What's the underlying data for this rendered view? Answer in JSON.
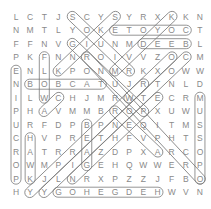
{
  "puzzle": {
    "grid": [
      [
        "L",
        "C",
        "T",
        "J",
        "S",
        "C",
        "Y",
        "S",
        "Y",
        "R",
        "X",
        "K",
        "K",
        "N"
      ],
      [
        "N",
        "M",
        "T",
        "L",
        "Y",
        "O",
        "K",
        "E",
        "T",
        "O",
        "Y",
        "O",
        "C",
        "T"
      ],
      [
        "F",
        "F",
        "N",
        "V",
        "G",
        "I",
        "U",
        "N",
        "M",
        "D",
        "E",
        "E",
        "B",
        "L"
      ],
      [
        "P",
        "K",
        "F",
        "N",
        "N",
        "R",
        "O",
        "I",
        "V",
        "V",
        "Z",
        "O",
        "C",
        "M"
      ],
      [
        "E",
        "N",
        "L",
        "K",
        "P",
        "O",
        "N",
        "M",
        "R",
        "K",
        "X",
        "O",
        "W",
        "W"
      ],
      [
        "N",
        "B",
        "O",
        "B",
        "C",
        "A",
        "T",
        "U",
        "J",
        "R",
        "T",
        "N",
        "L",
        "D"
      ],
      [
        "I",
        "L",
        "W",
        "C",
        "H",
        "J",
        "M",
        "R",
        "W",
        "T",
        "E",
        "C",
        "R",
        "M"
      ],
      [
        "P",
        "H",
        "A",
        "V",
        "M",
        "M",
        "B",
        "R",
        "O",
        "P",
        "X",
        "U",
        "W",
        "U"
      ],
      [
        "U",
        "R",
        "F",
        "D",
        "P",
        "B",
        "P",
        "N",
        "E",
        "Q",
        "I",
        "T",
        "M",
        "S"
      ],
      [
        "C",
        "H",
        "V",
        "P",
        "R",
        "E",
        "T",
        "H",
        "F",
        "V",
        "P",
        "H",
        "T",
        "S"
      ],
      [
        "R",
        "A",
        "T",
        "R",
        "R",
        "A",
        "Z",
        "D",
        "P",
        "X",
        "A",
        "R",
        "C",
        "O"
      ],
      [
        "O",
        "W",
        "M",
        "P",
        "I",
        "G",
        "E",
        "H",
        "Q",
        "W",
        "W",
        "E",
        "R",
        "P"
      ],
      [
        "P",
        "K",
        "J",
        "L",
        "N",
        "R",
        "X",
        "P",
        "Z",
        "Z",
        "J",
        "F",
        "B",
        "O"
      ],
      [
        "H",
        "Y",
        "Y",
        "G",
        "O",
        "H",
        "E",
        "G",
        "D",
        "E",
        "H",
        "W",
        "V",
        "N"
      ]
    ],
    "found_words": [
      {
        "word": "COYOTE",
        "start": [
          1,
          12
        ],
        "end": [
          1,
          7
        ]
      },
      {
        "word": "DEEB",
        "start": [
          2,
          9
        ],
        "end": [
          2,
          12
        ]
      },
      {
        "word": "BOBCAT",
        "start": [
          5,
          1
        ],
        "end": [
          5,
          6
        ]
      },
      {
        "word": "HEDGEHOG",
        "start": [
          13,
          10
        ],
        "end": [
          13,
          3
        ]
      },
      {
        "word": "PORCUPINE",
        "start": [
          12,
          0
        ],
        "end": [
          4,
          0
        ]
      },
      {
        "word": "HAWK",
        "start": [
          9,
          1
        ],
        "end": [
          12,
          1
        ]
      },
      {
        "word": "WOLF",
        "start": [
          6,
          2
        ],
        "end": [
          3,
          2
        ]
      },
      {
        "word": "BEAG",
        "start": [
          8,
          5
        ],
        "end": [
          11,
          5
        ]
      },
      {
        "word": "OPOSSUM",
        "start": [
          12,
          13
        ],
        "end": [
          6,
          13
        ]
      },
      {
        "word": "SOUIR",
        "start": [
          0,
          4
        ],
        "end": [
          4,
          8
        ]
      },
      {
        "word": "SKINK",
        "start": [
          0,
          7
        ],
        "end": [
          4,
          3
        ]
      },
      {
        "word": "DIAGONAL-1",
        "start": [
          3,
          5
        ],
        "end": [
          12,
          13
        ]
      },
      {
        "word": "DIAGONAL-2",
        "start": [
          3,
          12
        ],
        "end": [
          13,
          2
        ]
      },
      {
        "word": "DIAGONAL-3",
        "start": [
          5,
          9
        ],
        "end": [
          13,
          1
        ]
      },
      {
        "word": "DIAGONAL-4",
        "start": [
          7,
          7
        ],
        "end": [
          10,
          10
        ]
      },
      {
        "word": "DIAGONAL-5",
        "start": [
          6,
          3
        ],
        "end": [
          7,
          2
        ]
      },
      {
        "word": "DIAGONAL-6",
        "start": [
          0,
          11
        ],
        "end": [
          4,
          7
        ]
      },
      {
        "word": "DIAGONAL-7",
        "start": [
          3,
          11
        ],
        "end": [
          6,
          8
        ]
      },
      {
        "word": "DIAGONAL-8",
        "start": [
          2,
          4
        ],
        "end": [
          7,
          9
        ]
      },
      {
        "word": "DIAGONAL-9",
        "start": [
          6,
          10
        ],
        "end": [
          12,
          4
        ]
      }
    ]
  }
}
